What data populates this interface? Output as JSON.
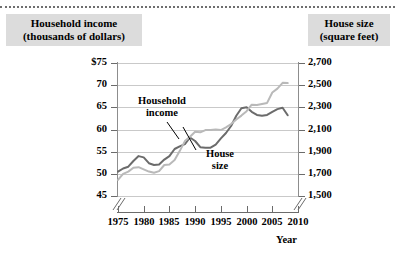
{
  "chart_data": {
    "type": "line",
    "title": "",
    "xlabel": "Year",
    "left_axis": {
      "label": "Household income",
      "label_sub": "(thousands of dollars)",
      "ticks": [
        "$75",
        "70",
        "65",
        "60",
        "55",
        "50",
        "45"
      ],
      "tick_values": [
        75,
        70,
        65,
        60,
        55,
        50,
        45
      ],
      "ylim": [
        45,
        75
      ],
      "axis_break": true
    },
    "right_axis": {
      "label": "House size",
      "label_sub": "(square feet)",
      "ticks": [
        "2,700",
        "2,500",
        "2,300",
        "2,100",
        "1,900",
        "1,700",
        "1,500"
      ],
      "tick_values": [
        2700,
        2500,
        2300,
        2100,
        1900,
        1700,
        1500
      ],
      "ylim": [
        1500,
        2700
      ],
      "axis_break": true
    },
    "x_ticks": [
      "1975",
      "1980",
      "1985",
      "1990",
      "1995",
      "2000",
      "2005",
      "2010"
    ],
    "x_tick_values": [
      1975,
      1980,
      1985,
      1990,
      1995,
      2000,
      2005,
      2010
    ],
    "xlim": [
      1975,
      2010
    ],
    "x_axis_break": true,
    "grid": true,
    "legend_position": "inline-annotations",
    "annotations": [
      {
        "text": "Household",
        "text2": "income",
        "series": "household_income"
      },
      {
        "text": "House",
        "text2": "size",
        "series": "house_size"
      }
    ],
    "series": [
      {
        "name": "Household income",
        "axis": "left",
        "color": "#6b6b6b",
        "x": [
          1975,
          1976,
          1977,
          1978,
          1979,
          1980,
          1981,
          1982,
          1983,
          1984,
          1985,
          1986,
          1987,
          1988,
          1989,
          1990,
          1991,
          1992,
          1993,
          1994,
          1995,
          1996,
          1997,
          1998,
          1999,
          2000,
          2001,
          2002,
          2003,
          2004,
          2005,
          2006,
          2007,
          2008
        ],
        "values": [
          50.5,
          51.2,
          51.6,
          52.9,
          54.0,
          53.7,
          52.4,
          52.0,
          52.1,
          53.2,
          54.0,
          55.6,
          56.2,
          56.7,
          58.2,
          57.4,
          56.0,
          55.9,
          55.9,
          56.6,
          58.0,
          59.2,
          60.8,
          63.1,
          64.8,
          65.0,
          64.0,
          63.3,
          63.1,
          63.3,
          64.0,
          64.6,
          64.9,
          63.2
        ]
      },
      {
        "name": "House size",
        "axis": "right",
        "color": "#b9b9b9",
        "x": [
          1975,
          1976,
          1977,
          1978,
          1979,
          1980,
          1981,
          1982,
          1983,
          1984,
          1985,
          1986,
          1987,
          1988,
          1989,
          1990,
          1991,
          1992,
          1993,
          1994,
          1995,
          1996,
          1997,
          1998,
          1999,
          2000,
          2001,
          2002,
          2003,
          2004,
          2005,
          2006,
          2007,
          2008
        ],
        "values": [
          1645,
          1700,
          1720,
          1755,
          1760,
          1740,
          1720,
          1710,
          1725,
          1780,
          1785,
          1825,
          1905,
          1995,
          2035,
          2080,
          2075,
          2095,
          2095,
          2100,
          2095,
          2120,
          2150,
          2190,
          2225,
          2265,
          2324,
          2320,
          2330,
          2340,
          2434,
          2469,
          2521,
          2519
        ]
      }
    ]
  },
  "header": {
    "left_line1": "Household income",
    "left_line2": "(thousands of dollars)",
    "right_line1": "House size",
    "right_line2": "(square feet)"
  },
  "xtitle": "Year",
  "annotations": {
    "income_l1": "Household",
    "income_l2": "income",
    "house_l1": "House",
    "house_l2": "size"
  },
  "colors": {
    "income_line": "#6b6b6b",
    "house_line": "#b9b9b9",
    "grid": "#c9c9c9",
    "header_bg": "#dcdcdc",
    "axis": "#6b6b6b"
  }
}
